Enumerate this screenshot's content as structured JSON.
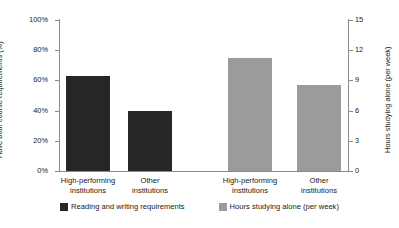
{
  "chart_data": {
    "type": "bar",
    "title": "",
    "subtitle": "",
    "grid": false,
    "legend_position": "bottom",
    "categories": [
      "High-performing institutions",
      "Other institutions"
    ],
    "category_lines": [
      [
        "High-performing",
        "institutions"
      ],
      [
        "Other",
        "institutions"
      ]
    ],
    "groups": [
      {
        "name": "Reading and writing requirements",
        "axis": "left",
        "color": "#262626",
        "categories": [
          "High-performing institutions",
          "Other institutions"
        ],
        "values": [
          63,
          40
        ],
        "unit": "%"
      },
      {
        "name": "Hours studying alone (per week)",
        "axis": "right",
        "color": "#9b9b9b",
        "categories": [
          "High-performing institutions",
          "Other institutions"
        ],
        "values": [
          11.2,
          8.5
        ],
        "unit": "hours per week"
      }
    ],
    "series": [
      {
        "name": "Reading and writing requirements",
        "values": [
          63,
          40
        ]
      },
      {
        "name": "Hours studying alone (per week)",
        "values": [
          11.2,
          8.5
        ]
      }
    ],
    "left_axis": {
      "label": "Have both course requirements (%)",
      "ticks": [
        "0%",
        "20%",
        "40%",
        "60%",
        "80%",
        "100%"
      ],
      "tick_values": [
        0,
        20,
        40,
        60,
        80,
        100
      ],
      "min": 0,
      "max": 100
    },
    "right_axis": {
      "label": "Hours studying alone (per week)",
      "ticks": [
        "0",
        "3",
        "6",
        "9",
        "12",
        "15"
      ],
      "tick_values": [
        0,
        3,
        6,
        9,
        12,
        15
      ],
      "min": 0,
      "max": 15
    },
    "xlabel": "",
    "ylabel": "Have both course requirements (%)",
    "legend": [
      {
        "label": "Reading and writing requirements",
        "color": "#262626"
      },
      {
        "label": "Hours studying alone (per week)",
        "color": "#9b9b9b"
      }
    ]
  },
  "colors": {
    "series_dark": "#262626",
    "series_gray": "#9b9b9b",
    "axis": "#8a8a8a",
    "text": "#1a1a1a",
    "background": "#ffffff"
  }
}
